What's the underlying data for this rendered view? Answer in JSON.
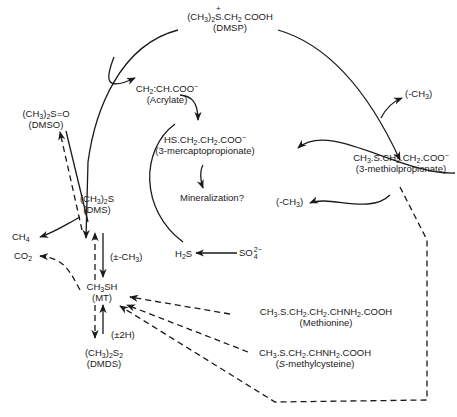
{
  "diagram": {
    "type": "pathway",
    "nodes": {
      "dmsp": {
        "formula_a": "(CH",
        "sub1": "3",
        "formula_b": ")",
        "sub2": "2",
        "formula_c": "S.CH",
        "sub3": "2",
        "formula_d": " COOH",
        "charge": "+",
        "name": "(DMSP)"
      },
      "acrylate": {
        "formula_a": "CH",
        "sub1": "2",
        "formula_b": ":CH.COO",
        "charge": "−",
        "name": "(Acrylate)"
      },
      "mercaptopropionate": {
        "formula_a": "HS.CH",
        "sub1": "2",
        "formula_b": ".CH",
        "sub2": "2",
        "formula_c": ".COO",
        "charge": "−",
        "name": "(3-mercaptopropionate)"
      },
      "methiolpropionate": {
        "formula_a": "CH",
        "sub1": "3",
        "formula_b": ".S.CH",
        "sub2": "2",
        "formula_c": ".CH",
        "sub3": "2",
        "formula_d": ".COO",
        "charge": "−",
        "name": "(3-methiolpropionate)"
      },
      "dmso": {
        "formula_a": "(CH",
        "sub1": "3",
        "formula_b": ")",
        "sub2": "2",
        "formula_c": "S=O",
        "name": "(DMSO)"
      },
      "dms": {
        "formula_a": "(CH",
        "sub1": "3",
        "formula_b": ")",
        "sub2": "2",
        "formula_c": "S",
        "name": "(DMS)"
      },
      "ch4": {
        "formula_a": "CH",
        "sub1": "4"
      },
      "co2": {
        "formula_a": "CO",
        "sub1": "2"
      },
      "mt": {
        "formula_a": "CH",
        "sub1": "3",
        "formula_b": "SH",
        "name": "(MT)"
      },
      "dmds": {
        "formula_a": "(CH",
        "sub1": "3",
        "formula_b": ")",
        "sub2": "2",
        "formula_c": "S",
        "sub3": "2",
        "name": "(DMDS)"
      },
      "h2s": {
        "formula_a": "H",
        "sub1": "2",
        "formula_b": "S"
      },
      "sulfate": {
        "formula_a": "SO",
        "sup": "2−",
        "sub": "4"
      },
      "mineralization": {
        "text": "Mineralization?"
      },
      "methionine": {
        "formula_a": "CH",
        "sub1": "3",
        "formula_b": ".S.CH",
        "sub2": "2",
        "formula_c": ".CH",
        "sub3": "2",
        "formula_d": ".CHNH",
        "sub4": "2",
        "formula_e": ".COOH",
        "name": "(Methionine)"
      },
      "smethylcysteine": {
        "formula_a": "CH",
        "sub1": "3",
        "formula_b": ".S.CH",
        "sub2": "2",
        "formula_c": ".CHNH",
        "sub3": "2",
        "formula_d": ".COOH",
        "name_italic": "S",
        "name_rest": "-methylcysteine)",
        "name_open": "("
      }
    },
    "annotations": {
      "demethyl_top": {
        "a": "(-CH",
        "sub": "3",
        "b": ")"
      },
      "demethyl_mid": {
        "a": "(-CH",
        "sub": "3",
        "b": ")"
      },
      "pm_ch3": {
        "a": "(±-CH",
        "sub": "3",
        "b": ")"
      },
      "pm_2h": {
        "a": "(±2H)"
      }
    },
    "colors": {
      "line": "#1a1a1a",
      "background": "#ffffff"
    }
  }
}
